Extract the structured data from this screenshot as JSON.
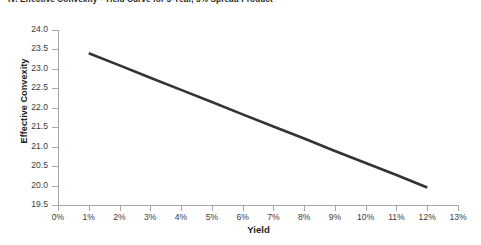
{
  "chart_data": {
    "type": "line",
    "title": "IV. Effective Convexity - Yield Curve for 5-Year, 5% Spread Product",
    "xlabel": "Yield",
    "ylabel": "Effective Convexity",
    "xlim": [
      0,
      13
    ],
    "ylim": [
      19.5,
      24.0
    ],
    "grid": false,
    "legend": false,
    "x_tick_labels": [
      "0%",
      "1%",
      "2%",
      "3%",
      "4%",
      "5%",
      "6%",
      "7%",
      "8%",
      "9%",
      "10%",
      "11%",
      "12%",
      "13%"
    ],
    "x_tick_values": [
      0,
      1,
      2,
      3,
      4,
      5,
      6,
      7,
      8,
      9,
      10,
      11,
      12,
      13
    ],
    "y_tick_labels": [
      "19.5",
      "20.0",
      "20.5",
      "21.0",
      "21.5",
      "22.0",
      "22.5",
      "23.0",
      "23.5",
      "24.0"
    ],
    "y_tick_values": [
      19.5,
      20.0,
      20.5,
      21.0,
      21.5,
      22.0,
      22.5,
      23.0,
      23.5,
      24.0
    ],
    "series": [
      {
        "name": "Effective Convexity",
        "color": "#333333",
        "line_width": 2.6,
        "x": [
          1,
          2,
          3,
          4,
          5,
          6,
          7,
          8,
          9,
          10,
          11,
          12
        ],
        "values": [
          23.4,
          23.09,
          22.77,
          22.46,
          22.15,
          21.83,
          21.52,
          21.21,
          20.89,
          20.58,
          20.27,
          19.95
        ]
      }
    ]
  },
  "colors": {
    "background": "#ffffff",
    "axis": "#a6a6a6",
    "tick_text": "#3b3b3b",
    "axis_title": "#231f20",
    "series": "#333333"
  }
}
